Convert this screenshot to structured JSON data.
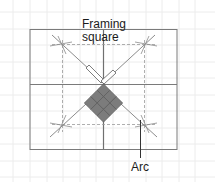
{
  "labels": {
    "framing_square_line1": "Framing",
    "framing_square_line2": "square",
    "arc": "Arc"
  },
  "colors": {
    "background": "#ffffff",
    "grid": "#eeeeee",
    "frame": "#7a7a7a",
    "dashed": "#9a9a9a",
    "diagonal": "#8c8c8c",
    "tile_fill": "#7c7c7c",
    "tile_stroke": "#5e5e5e",
    "leader": "#333333",
    "text": "#1a1a1a"
  }
}
